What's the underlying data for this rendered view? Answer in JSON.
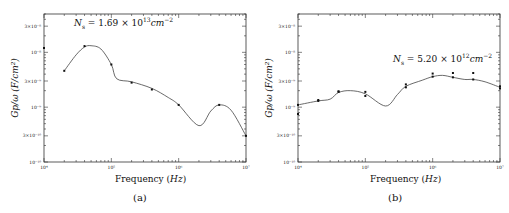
{
  "chart_data": [
    {
      "id": "a",
      "type": "line",
      "caption": "(a)",
      "title": "",
      "annotation": "N_s = 1.69 × 10^13 cm^-2",
      "annotation_parts": {
        "lhs": "N",
        "sub": "s",
        "eq": " = 1.69 × 10",
        "exp": "13",
        "unit": "cm",
        "unit_exp": "−2"
      },
      "xlabel": "Frequency (Hz)",
      "xlabel_parts": {
        "text": "Frequency (",
        "unit": "Hz",
        "close": ")"
      },
      "ylabel": "Gp/ω (F/cm²)",
      "xscale": "log",
      "yscale": "log",
      "xlim": [
        10000,
        10000000
      ],
      "ylim": [
        1e-10,
        5e-08
      ],
      "x_ticks": [
        "10⁴",
        "10⁵",
        "10⁶",
        "10⁷"
      ],
      "y_ticks": [
        "10⁻¹⁰",
        "3×10⁻¹⁰",
        "10⁻⁹",
        "3×10⁻⁹",
        "10⁻⁸",
        "3×10⁻⁸"
      ],
      "grid": false,
      "points": [
        {
          "x": 10000,
          "y": 1.2e-08
        },
        {
          "x": 20000,
          "y": 4.6e-09
        },
        {
          "x": 40000,
          "y": 1.3e-08
        },
        {
          "x": 100000,
          "y": 6e-09
        },
        {
          "x": 200000,
          "y": 2.8e-09
        },
        {
          "x": 400000,
          "y": 2.1e-09
        },
        {
          "x": 1000000,
          "y": 1.1e-09
        },
        {
          "x": 4000000,
          "y": 1.1e-09
        },
        {
          "x": 10000000,
          "y": 3e-10
        }
      ],
      "fit_curve": [
        {
          "x": 20000,
          "y": 4.6e-09
        },
        {
          "x": 30000,
          "y": 9e-09
        },
        {
          "x": 40000,
          "y": 1.25e-08
        },
        {
          "x": 50000,
          "y": 1.32e-08
        },
        {
          "x": 70000,
          "y": 1.15e-08
        },
        {
          "x": 100000,
          "y": 6e-09
        },
        {
          "x": 120000,
          "y": 3.3e-09
        },
        {
          "x": 200000,
          "y": 2.9e-09
        },
        {
          "x": 400000,
          "y": 2.2e-09
        },
        {
          "x": 700000,
          "y": 1.5e-09
        },
        {
          "x": 1000000,
          "y": 1.1e-09
        },
        {
          "x": 2000000,
          "y": 4.6e-10
        },
        {
          "x": 3000000,
          "y": 8.5e-10
        },
        {
          "x": 4000000,
          "y": 1.1e-09
        },
        {
          "x": 6000000,
          "y": 8.8e-10
        },
        {
          "x": 10000000,
          "y": 3e-10
        }
      ]
    },
    {
      "id": "b",
      "type": "line",
      "caption": "(b)",
      "title": "",
      "annotation": "N_s = 5.20 × 10^12 cm^-2",
      "annotation_parts": {
        "lhs": "N",
        "sub": "s",
        "eq": " = 5.20 × 10",
        "exp": "12",
        "unit": "cm",
        "unit_exp": "−2"
      },
      "xlabel": "Frequency (Hz)",
      "xlabel_parts": {
        "text": "Frequency (",
        "unit": "Hz",
        "close": ")"
      },
      "ylabel": "Gp/ω (F/cm²)",
      "xscale": "log",
      "yscale": "log",
      "xlim": [
        10000,
        10000000
      ],
      "ylim": [
        1e-10,
        5e-08
      ],
      "x_ticks": [
        "10⁴",
        "10⁵",
        "10⁶",
        "10⁷"
      ],
      "y_ticks": [
        "10⁻¹⁰",
        "3×10⁻¹⁰",
        "10⁻⁹",
        "3×10⁻⁹",
        "10⁻⁸",
        "3×10⁻⁸"
      ],
      "grid": false,
      "points": [
        {
          "x": 10000,
          "y": 1.1e-09
        },
        {
          "x": 10000,
          "y": 7.5e-10
        },
        {
          "x": 20000,
          "y": 1.3e-09
        },
        {
          "x": 20000,
          "y": 1.35e-09
        },
        {
          "x": 40000,
          "y": 1.9e-09
        },
        {
          "x": 40000,
          "y": 1.95e-09
        },
        {
          "x": 100000,
          "y": 1.6e-09
        },
        {
          "x": 100000,
          "y": 1.9e-09
        },
        {
          "x": 400000,
          "y": 2.3e-09
        },
        {
          "x": 400000,
          "y": 2.6e-09
        },
        {
          "x": 1000000,
          "y": 3.6e-09
        },
        {
          "x": 1000000,
          "y": 4.1e-09
        },
        {
          "x": 2000000,
          "y": 3.5e-09
        },
        {
          "x": 2000000,
          "y": 4.2e-09
        },
        {
          "x": 4000000,
          "y": 3.2e-09
        },
        {
          "x": 4000000,
          "y": 4.2e-09
        },
        {
          "x": 10000000,
          "y": 2.2e-09
        },
        {
          "x": 10000000,
          "y": 2.4e-09
        }
      ],
      "fit_curve": [
        {
          "x": 10000,
          "y": 1.1e-09
        },
        {
          "x": 20000,
          "y": 1.3e-09
        },
        {
          "x": 30000,
          "y": 1.4e-09
        },
        {
          "x": 40000,
          "y": 1.85e-09
        },
        {
          "x": 60000,
          "y": 2e-09
        },
        {
          "x": 100000,
          "y": 1.75e-09
        },
        {
          "x": 200000,
          "y": 1.05e-09
        },
        {
          "x": 300000,
          "y": 1.7e-09
        },
        {
          "x": 400000,
          "y": 2.4e-09
        },
        {
          "x": 700000,
          "y": 3.1e-09
        },
        {
          "x": 1000000,
          "y": 3.6e-09
        },
        {
          "x": 1400000,
          "y": 3.8e-09
        },
        {
          "x": 2000000,
          "y": 3.5e-09
        },
        {
          "x": 3000000,
          "y": 3.2e-09
        },
        {
          "x": 4000000,
          "y": 3.2e-09
        },
        {
          "x": 6000000,
          "y": 2.9e-09
        },
        {
          "x": 10000000,
          "y": 2.3e-09
        }
      ]
    }
  ]
}
